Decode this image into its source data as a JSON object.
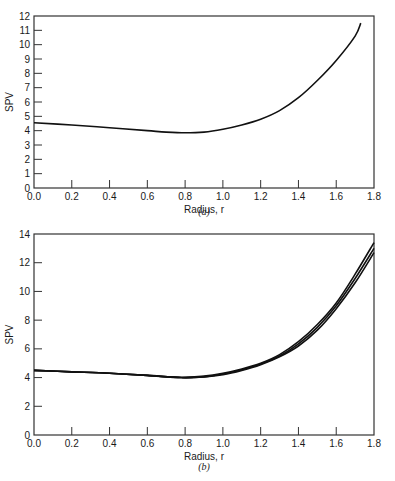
{
  "chart_data": [
    {
      "type": "line",
      "panel": "a",
      "caption": "(a)",
      "title": "",
      "xlabel": "Radius, r",
      "ylabel": "SPV",
      "xlim": [
        0.0,
        1.8
      ],
      "ylim": [
        0,
        12
      ],
      "xticks": [
        "0.0",
        "0.2",
        "0.4",
        "0.6",
        "0.8",
        "1.0",
        "1.2",
        "1.4",
        "1.6",
        "1.8"
      ],
      "yticks": [
        "0",
        "1",
        "2",
        "3",
        "4",
        "5",
        "6",
        "7",
        "8",
        "9",
        "10",
        "11",
        "12"
      ],
      "grid": false,
      "series": [
        {
          "name": "SPV",
          "x": [
            0.0,
            0.2,
            0.4,
            0.6,
            0.7,
            0.8,
            0.9,
            1.0,
            1.1,
            1.2,
            1.3,
            1.4,
            1.5,
            1.6,
            1.7,
            1.73
          ],
          "y": [
            4.55,
            4.4,
            4.2,
            4.0,
            3.9,
            3.85,
            3.9,
            4.1,
            4.4,
            4.8,
            5.4,
            6.3,
            7.5,
            8.9,
            10.6,
            11.5
          ]
        }
      ]
    },
    {
      "type": "line",
      "panel": "b",
      "caption": "(b)",
      "title": "",
      "xlabel": "Radius, r",
      "ylabel": "SPV",
      "xlim": [
        0.0,
        1.8
      ],
      "ylim": [
        0,
        14
      ],
      "xticks": [
        "0.0",
        "0.2",
        "0.4",
        "0.6",
        "0.8",
        "1.0",
        "1.2",
        "1.4",
        "1.6",
        "1.8"
      ],
      "yticks": [
        "0",
        "2",
        "4",
        "6",
        "8",
        "10",
        "12",
        "14"
      ],
      "grid": false,
      "series": [
        {
          "name": "curve 1",
          "x": [
            0.0,
            0.2,
            0.4,
            0.6,
            0.78,
            0.9,
            1.0,
            1.1,
            1.2,
            1.3,
            1.4,
            1.5,
            1.6,
            1.7,
            1.8
          ],
          "y": [
            4.5,
            4.4,
            4.3,
            4.15,
            4.0,
            4.1,
            4.3,
            4.6,
            5.0,
            5.6,
            6.5,
            7.7,
            9.2,
            11.2,
            13.4
          ]
        },
        {
          "name": "curve 2",
          "x": [
            0.0,
            0.2,
            0.4,
            0.6,
            0.78,
            0.9,
            1.0,
            1.1,
            1.2,
            1.3,
            1.4,
            1.5,
            1.6,
            1.7,
            1.8
          ],
          "y": [
            4.5,
            4.4,
            4.3,
            4.15,
            4.0,
            4.05,
            4.25,
            4.55,
            4.95,
            5.5,
            6.35,
            7.5,
            9.0,
            10.9,
            13.0
          ]
        },
        {
          "name": "curve 3",
          "x": [
            0.0,
            0.2,
            0.4,
            0.6,
            0.78,
            0.9,
            1.0,
            1.1,
            1.2,
            1.3,
            1.4,
            1.5,
            1.6,
            1.7,
            1.8
          ],
          "y": [
            4.5,
            4.4,
            4.3,
            4.15,
            4.0,
            4.05,
            4.2,
            4.5,
            4.9,
            5.45,
            6.2,
            7.3,
            8.8,
            10.6,
            12.7
          ]
        }
      ]
    }
  ]
}
